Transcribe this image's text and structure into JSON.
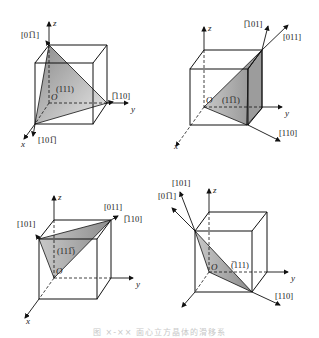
{
  "figure": {
    "caption": "图 ×-×× 面心立方晶体的滑移系",
    "colors": {
      "line": "#111111",
      "plane_fill": "#9a9a9a",
      "plane_light": "#e6e6e6"
    },
    "panels": [
      {
        "id": "top-left",
        "plane_label": "(111)",
        "axes": {
          "x": "x",
          "y": "y",
          "z": "z",
          "origin": "O"
        },
        "directions": [
          "[0̅1̅1]",
          "[̅1̅10]",
          "[10̅1]"
        ],
        "direction_display": [
          "[01̅1]",
          "[̅10]",
          "[101̅]"
        ]
      },
      {
        "id": "top-right",
        "plane_label": "(11̅1)",
        "axes": {
          "x": "x",
          "y": "y",
          "z": "z",
          "origin": "O"
        },
        "directions": [
          "[̅101]",
          "[011]",
          "[110]"
        ]
      },
      {
        "id": "bottom-left",
        "plane_label": "(111̅)",
        "axes": {
          "x": "x",
          "y": "y",
          "z": "z",
          "origin": "O"
        },
        "directions": [
          "[101]",
          "[011]",
          "[̅110]"
        ]
      },
      {
        "id": "bottom-right",
        "plane_label": "(̅111)",
        "axes": {
          "x": "x",
          "y": "y",
          "z": "z",
          "origin": "O"
        },
        "directions": [
          "[101]",
          "[01̅1]",
          "[110]"
        ]
      }
    ],
    "labels": {
      "p1": {
        "plane": "(111)",
        "d1": "[01̅1]",
        "d2": "[̅110]",
        "d3": "[101̅]"
      },
      "p2": {
        "plane": "(11̅1)",
        "d1": "[̅101]",
        "d2": "[011]",
        "d3": "[110]"
      },
      "p3": {
        "plane": "(111̅)",
        "d1": "[101]",
        "d2": "[011]",
        "d3": "[̅110]"
      },
      "p4": {
        "plane": "(̅111)",
        "d1": "[101]",
        "d2": "[01̅1]",
        "d3": "[110]"
      },
      "axis_x": "x",
      "axis_y": "y",
      "axis_z": "z",
      "origin": "O"
    }
  }
}
